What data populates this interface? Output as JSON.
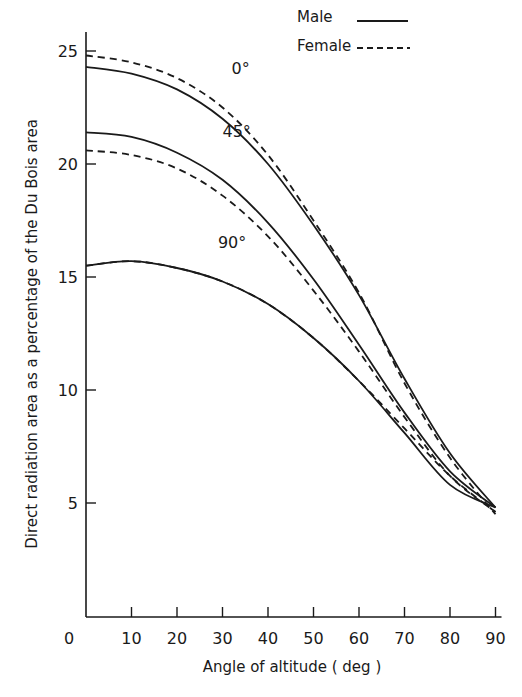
{
  "chart_data": {
    "type": "line",
    "title": "",
    "xlabel": "Angle of altitude ( deg )",
    "ylabel": "Direct radiation area as a percentage of the Du Bois area",
    "xlim": [
      0,
      90
    ],
    "ylim": [
      0,
      25
    ],
    "grid": false,
    "legend_position": "top-right",
    "legend": [
      {
        "label": "Male",
        "style": "solid"
      },
      {
        "label": "Female",
        "style": "dashed"
      }
    ],
    "x_ticks": [
      0,
      10,
      20,
      30,
      40,
      50,
      60,
      70,
      80,
      90
    ],
    "x_tick_labels": [
      "0",
      "10",
      "20",
      "30",
      "40",
      "50",
      "60",
      "70",
      "80",
      "90"
    ],
    "y_ticks": [
      5,
      10,
      15,
      20,
      25
    ],
    "y_tick_labels": [
      "5",
      "10",
      "15",
      "20",
      "25"
    ],
    "annotations": [
      {
        "text": "0°",
        "x": 32,
        "y": 24.0
      },
      {
        "text": "45°",
        "x": 30,
        "y": 21.2
      },
      {
        "text": "90°",
        "x": 29,
        "y": 16.3
      }
    ],
    "x": [
      0,
      10,
      20,
      30,
      40,
      50,
      60,
      70,
      80,
      90
    ],
    "series": [
      {
        "name": "0° Male",
        "style": "solid",
        "values": [
          24.3,
          24.0,
          23.3,
          22.0,
          20.0,
          17.3,
          14.2,
          10.5,
          7.2,
          4.8
        ]
      },
      {
        "name": "0° Female",
        "style": "dashed",
        "values": [
          24.8,
          24.5,
          23.8,
          22.5,
          20.4,
          17.5,
          14.3,
          10.3,
          7.0,
          4.5
        ]
      },
      {
        "name": "45° Male",
        "style": "solid",
        "values": [
          21.4,
          21.2,
          20.5,
          19.3,
          17.4,
          14.9,
          12.0,
          9.0,
          6.4,
          4.8
        ]
      },
      {
        "name": "45° Female",
        "style": "dashed",
        "values": [
          20.6,
          20.4,
          19.8,
          18.6,
          16.8,
          14.4,
          11.7,
          8.8,
          6.2,
          4.6
        ]
      },
      {
        "name": "90° Male",
        "style": "solid",
        "values": [
          15.5,
          15.7,
          15.4,
          14.8,
          13.8,
          12.3,
          10.4,
          8.1,
          5.8,
          4.8
        ]
      },
      {
        "name": "90° Female",
        "style": "dashed",
        "values": [
          15.5,
          15.7,
          15.4,
          14.8,
          13.8,
          12.3,
          10.4,
          8.3,
          6.2,
          4.6
        ]
      }
    ]
  },
  "colors": {
    "ink": "#1a1a1a",
    "background": "#ffffff"
  }
}
